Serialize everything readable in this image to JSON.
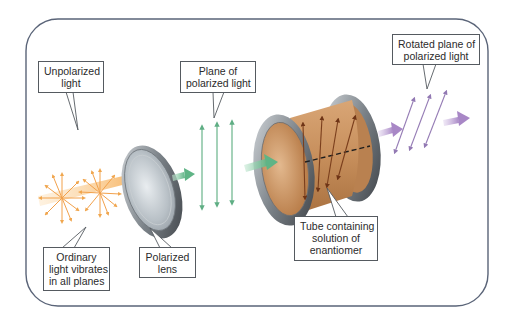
{
  "figure": {
    "frame_border_color": "#5a6478",
    "labels": {
      "unpolarized": {
        "lines": [
          "Unpolarized",
          "light"
        ]
      },
      "ordinary": {
        "lines": [
          "Ordinary",
          "light vibrates",
          "in all planes"
        ]
      },
      "polarized_lens": {
        "lines": [
          "Polarized",
          "lens"
        ]
      },
      "plane_polarized": {
        "lines": [
          "Plane of",
          "polarized light"
        ]
      },
      "tube": {
        "lines": [
          "Tube containing",
          "solution of",
          "enantiomer"
        ]
      },
      "rotated": {
        "lines": [
          "Rotated plane of",
          "polarized light"
        ]
      }
    },
    "colors": {
      "unpolarized_light": "#f5b35c",
      "polarized_light": "#6dbb8f",
      "rotated_light": "#a98bc4",
      "tube_body": "#c9925f",
      "lens_metal": "#8d949b",
      "tube_vectors": "#7a3e1c"
    },
    "components": [
      "unpolarized-light-source",
      "polarized-lens",
      "plane-polarized-light",
      "sample-tube",
      "rotated-polarized-light"
    ]
  }
}
